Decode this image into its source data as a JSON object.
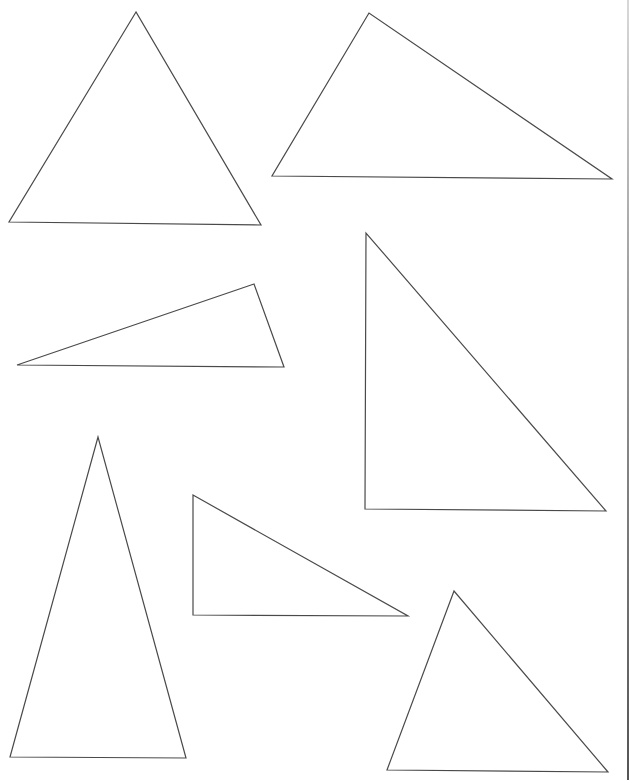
{
  "page": {
    "kind": "worksheet-of-triangles",
    "stroke_color": "#4a4a4a",
    "background": "#ffffff",
    "triangle_count": 7
  },
  "triangles": [
    {
      "id": "triangle-1",
      "shape": "acute"
    },
    {
      "id": "triangle-2",
      "shape": "obtuse"
    },
    {
      "id": "triangle-3",
      "shape": "obtuse"
    },
    {
      "id": "triangle-4",
      "shape": "right"
    },
    {
      "id": "triangle-5",
      "shape": "acute-isosceles"
    },
    {
      "id": "triangle-6",
      "shape": "right"
    },
    {
      "id": "triangle-7",
      "shape": "acute"
    }
  ]
}
